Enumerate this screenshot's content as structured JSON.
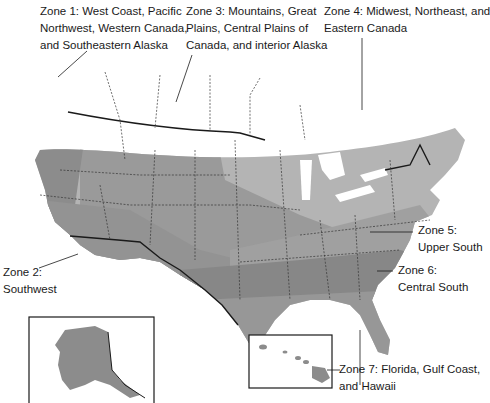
{
  "map": {
    "title": "North American climate zones",
    "zones": [
      {
        "id": 1,
        "lines": [
          "Zone 1: West Coast, Pacific",
          "Northwest, Western Canada,",
          "and Southeastern Alaska"
        ],
        "color": "#8c8c8c"
      },
      {
        "id": 2,
        "lines": [
          "Zone 2:",
          "Southwest"
        ],
        "color": "#939393"
      },
      {
        "id": 3,
        "lines": [
          "Zone 3: Mountains, Great",
          "Plains, Central Plains of",
          "Canada, and interior Alaska"
        ],
        "color": "#9a9a9a"
      },
      {
        "id": 4,
        "lines": [
          "Zone 4: Midwest, Northeast, and",
          "Eastern Canada"
        ],
        "color": "#b4b4b4"
      },
      {
        "id": 5,
        "lines": [
          "Zone 5:",
          "Upper South"
        ],
        "color": "#a0a0a0"
      },
      {
        "id": 6,
        "lines": [
          "Zone 6:",
          "Central South"
        ],
        "color": "#878787"
      },
      {
        "id": 7,
        "lines": [
          "Zone 7: Florida, Gulf Coast,",
          "and Hawaii"
        ],
        "color": "#979797"
      }
    ],
    "insets": [
      {
        "name": "Alaska"
      },
      {
        "name": "Hawaii"
      }
    ]
  }
}
